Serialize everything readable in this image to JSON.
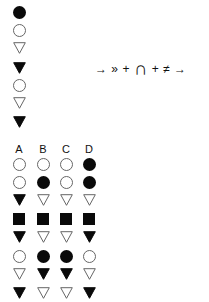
{
  "question": {
    "sequence": [
      {
        "shape": "circle",
        "fill": "filled"
      },
      {
        "shape": "circle",
        "fill": "hollow"
      },
      {
        "shape": "triangle",
        "fill": "hollow"
      },
      {
        "shape": "triangle",
        "fill": "filled"
      },
      {
        "shape": "circle",
        "fill": "hollow"
      },
      {
        "shape": "triangle",
        "fill": "hollow"
      },
      {
        "shape": "triangle",
        "fill": "filled"
      }
    ],
    "transform_text": {
      "arrow_left": "→",
      "chevrons": "»",
      "plus1": "+",
      "cap": "∩",
      "plus2": "+",
      "neq": "≠",
      "arrow_right": "→"
    }
  },
  "options": {
    "labels": [
      "A",
      "B",
      "C",
      "D"
    ],
    "columns": [
      [
        {
          "shape": "circle",
          "fill": "hollow"
        },
        {
          "shape": "circle",
          "fill": "hollow"
        },
        {
          "shape": "triangle",
          "fill": "filled"
        },
        {
          "shape": "square",
          "fill": "filled"
        },
        {
          "shape": "triangle",
          "fill": "filled"
        },
        {
          "shape": "circle",
          "fill": "hollow"
        },
        {
          "shape": "triangle",
          "fill": "hollow"
        },
        {
          "shape": "triangle",
          "fill": "filled"
        }
      ],
      [
        {
          "shape": "circle",
          "fill": "hollow"
        },
        {
          "shape": "circle",
          "fill": "filled"
        },
        {
          "shape": "triangle",
          "fill": "hollow"
        },
        {
          "shape": "square",
          "fill": "filled"
        },
        {
          "shape": "triangle",
          "fill": "hollow"
        },
        {
          "shape": "circle",
          "fill": "filled"
        },
        {
          "shape": "triangle",
          "fill": "filled"
        },
        {
          "shape": "triangle",
          "fill": "hollow"
        }
      ],
      [
        {
          "shape": "circle",
          "fill": "hollow"
        },
        {
          "shape": "circle",
          "fill": "hollow"
        },
        {
          "shape": "triangle",
          "fill": "hollow"
        },
        {
          "shape": "square",
          "fill": "filled"
        },
        {
          "shape": "triangle",
          "fill": "hollow"
        },
        {
          "shape": "circle",
          "fill": "filled"
        },
        {
          "shape": "triangle",
          "fill": "filled"
        },
        {
          "shape": "triangle",
          "fill": "hollow"
        }
      ],
      [
        {
          "shape": "circle",
          "fill": "filled"
        },
        {
          "shape": "circle",
          "fill": "filled"
        },
        {
          "shape": "triangle",
          "fill": "hollow"
        },
        {
          "shape": "square",
          "fill": "filled"
        },
        {
          "shape": "triangle",
          "fill": "filled"
        },
        {
          "shape": "circle",
          "fill": "hollow"
        },
        {
          "shape": "triangle",
          "fill": "hollow"
        },
        {
          "shape": "triangle",
          "fill": "filled"
        }
      ]
    ]
  }
}
